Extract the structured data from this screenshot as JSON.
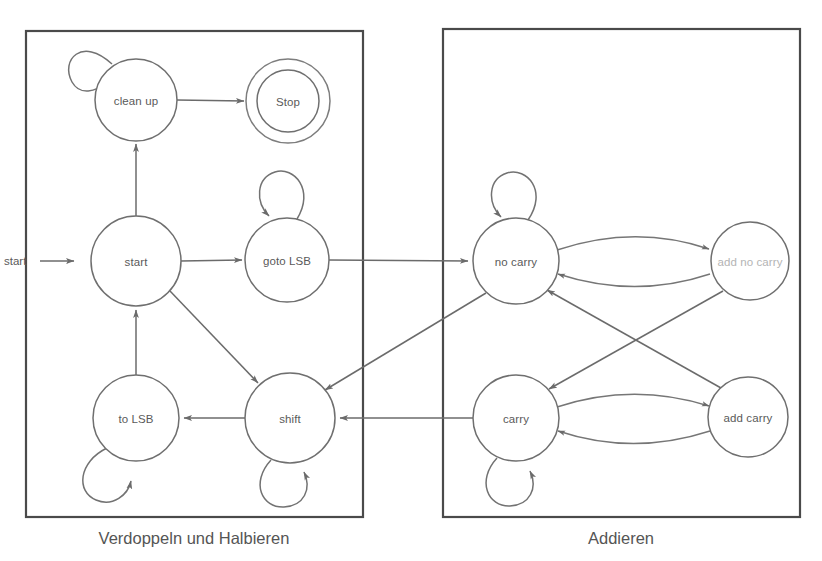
{
  "diagram": {
    "background_color": "#ffffff",
    "line_color": "#6b6b6b",
    "box_color": "#4a4a4a",
    "text_color": "#5a5a5a",
    "faint_text_color": "#b4b4b4",
    "groups": [
      {
        "id": "left-group",
        "caption": "Verdoppeln und Halbieren",
        "x": 26,
        "y": 31,
        "width": 337,
        "height": 486,
        "caption_x": 194,
        "caption_y": 538
      },
      {
        "id": "right-group",
        "caption": "Addieren",
        "x": 443,
        "y": 29,
        "width": 357,
        "height": 488,
        "caption_x": 621,
        "caption_y": 538
      }
    ],
    "entry": {
      "label": "start",
      "label_x": 4,
      "label_y": 261,
      "arrow_from_x": 40,
      "arrow_to_x": 76,
      "arrow_y": 261
    },
    "states": [
      {
        "id": "clean-up",
        "label": "clean up",
        "cx": 136,
        "cy": 100,
        "r": 41,
        "accepting": false,
        "faint": false
      },
      {
        "id": "stop",
        "label": "Stop",
        "cx": 288,
        "cy": 101,
        "r": 31,
        "accepting": true,
        "outer_r": 42,
        "faint": false
      },
      {
        "id": "start",
        "label": "start",
        "cx": 136,
        "cy": 261,
        "r": 45,
        "accepting": false,
        "faint": false
      },
      {
        "id": "goto-lsb",
        "label": "goto LSB",
        "cx": 287,
        "cy": 260,
        "r": 42,
        "accepting": false,
        "faint": false
      },
      {
        "id": "to-lsb",
        "label": "to LSB",
        "cx": 136,
        "cy": 418,
        "r": 43,
        "accepting": false,
        "faint": false
      },
      {
        "id": "shift",
        "label": "shift",
        "cx": 290,
        "cy": 418,
        "r": 45,
        "accepting": false,
        "faint": false
      },
      {
        "id": "no-carry",
        "label": "no carry",
        "cx": 516,
        "cy": 261,
        "r": 43,
        "accepting": false,
        "faint": false
      },
      {
        "id": "add-no-carry",
        "label": "add no carry",
        "cx": 750,
        "cy": 261,
        "r": 39,
        "accepting": false,
        "faint": true
      },
      {
        "id": "carry",
        "label": "carry",
        "cx": 516,
        "cy": 418,
        "r": 43,
        "accepting": false,
        "faint": false
      },
      {
        "id": "add-carry",
        "label": "add carry",
        "cx": 748,
        "cy": 417,
        "r": 40,
        "accepting": false,
        "faint": false
      }
    ],
    "self_loops": [
      {
        "id": "loop-clean-up",
        "state": "clean up",
        "position": "top-left"
      },
      {
        "id": "loop-goto-lsb",
        "state": "goto LSB",
        "position": "top"
      },
      {
        "id": "loop-to-lsb",
        "state": "to LSB",
        "position": "bottom-left"
      },
      {
        "id": "loop-shift",
        "state": "shift",
        "position": "bottom"
      },
      {
        "id": "loop-no-carry",
        "state": "no carry",
        "position": "top"
      },
      {
        "id": "loop-carry",
        "state": "carry",
        "position": "bottom"
      }
    ],
    "transitions": [
      {
        "id": "t-cleanup-stop",
        "from": "clean up",
        "to": "Stop",
        "kind": "straight"
      },
      {
        "id": "t-start-cleanup",
        "from": "start",
        "to": "clean up",
        "kind": "straight"
      },
      {
        "id": "t-start-gotolsb",
        "from": "start",
        "to": "goto LSB",
        "kind": "straight"
      },
      {
        "id": "t-start-shift",
        "from": "start",
        "to": "shift",
        "kind": "diagonal"
      },
      {
        "id": "t-tolsb-start",
        "from": "to LSB",
        "to": "start",
        "kind": "straight"
      },
      {
        "id": "t-shift-tolsb",
        "from": "shift",
        "to": "to LSB",
        "kind": "straight"
      },
      {
        "id": "t-gotolsb-nocarry",
        "from": "goto LSB",
        "to": "no carry",
        "kind": "straight"
      },
      {
        "id": "t-nocarry-shift",
        "from": "no carry",
        "to": "shift",
        "kind": "diagonal"
      },
      {
        "id": "t-carry-shift",
        "from": "carry",
        "to": "shift",
        "kind": "straight"
      },
      {
        "id": "t-nocarry-addnocarry",
        "from": "no carry",
        "to": "add no carry",
        "kind": "curve-up"
      },
      {
        "id": "t-addnocarry-nocarry",
        "from": "add no carry",
        "to": "no carry",
        "kind": "curve-down"
      },
      {
        "id": "t-carry-addcarry",
        "from": "carry",
        "to": "add carry",
        "kind": "curve-up"
      },
      {
        "id": "t-addcarry-carry",
        "from": "add carry",
        "to": "carry",
        "kind": "curve-down"
      },
      {
        "id": "t-addnocarry-carry",
        "from": "add no carry",
        "to": "carry",
        "kind": "diagonal"
      },
      {
        "id": "t-addcarry-nocarry",
        "from": "add carry",
        "to": "no carry",
        "kind": "diagonal"
      }
    ]
  }
}
